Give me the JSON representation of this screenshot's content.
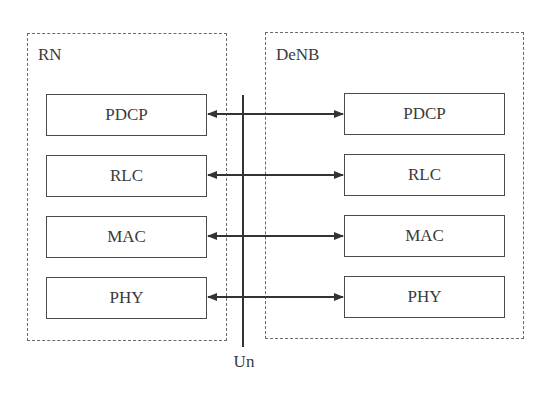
{
  "diagram": {
    "nodes": [
      {
        "id": "rn",
        "label": "RN",
        "layers": [
          "PDCP",
          "RLC",
          "MAC",
          "PHY"
        ]
      },
      {
        "id": "denb",
        "label": "DeNB",
        "layers": [
          "PDCP",
          "RLC",
          "MAC",
          "PHY"
        ]
      }
    ],
    "interface": {
      "label": "Un"
    },
    "connections": [
      {
        "from": "RN.PDCP",
        "to": "DeNB.PDCP",
        "type": "bidirectional"
      },
      {
        "from": "RN.RLC",
        "to": "DeNB.RLC",
        "type": "bidirectional"
      },
      {
        "from": "RN.MAC",
        "to": "DeNB.MAC",
        "type": "bidirectional"
      },
      {
        "from": "RN.PHY",
        "to": "DeNB.PHY",
        "type": "bidirectional"
      }
    ]
  }
}
